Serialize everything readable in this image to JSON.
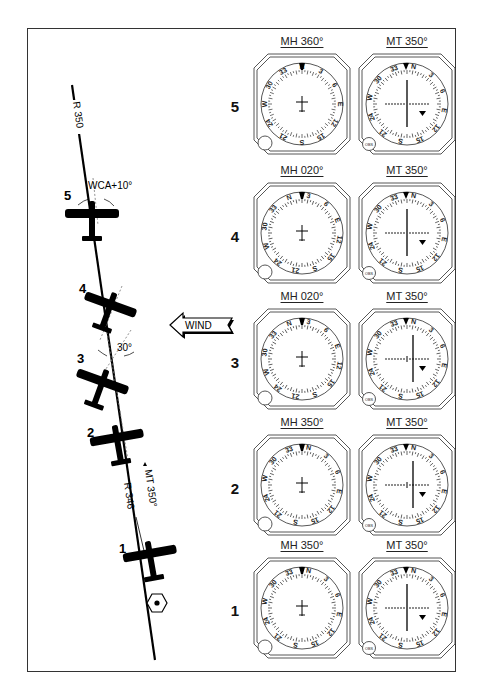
{
  "figure": {
    "wind_label": "WIND",
    "left_diagram": {
      "radial_top_label": "R 350",
      "radial_bottom_label": "R 346",
      "course_label": "MT 350°",
      "wca_label": "WCA+10°",
      "intercept_angle_label": "30°",
      "station_icon": "vor-station-hexagon-icon",
      "aircraft_positions": [
        {
          "number": "5",
          "heading_deg": 360
        },
        {
          "number": "4",
          "heading_deg": 20
        },
        {
          "number": "3",
          "heading_deg": 20
        },
        {
          "number": "2",
          "heading_deg": 350
        },
        {
          "number": "1",
          "heading_deg": 350
        }
      ]
    },
    "rows": [
      {
        "number": "5",
        "hi_title": "MH 360°",
        "hi_heading": 360,
        "vor_title": "MT 350°",
        "obs_course": 350,
        "cdi": "centered",
        "flag": "FROM"
      },
      {
        "number": "4",
        "hi_title": "MH 020°",
        "hi_heading": 20,
        "vor_title": "MT 350°",
        "obs_course": 350,
        "cdi": "centered",
        "flag": "FROM"
      },
      {
        "number": "3",
        "hi_title": "MH 020°",
        "hi_heading": 20,
        "vor_title": "MT 350°",
        "obs_course": 350,
        "cdi": "right",
        "flag": "FROM"
      },
      {
        "number": "2",
        "hi_title": "MH 350°",
        "hi_heading": 350,
        "vor_title": "MT 350°",
        "obs_course": 350,
        "cdi": "right",
        "flag": "FROM"
      },
      {
        "number": "1",
        "hi_title": "MH 350°",
        "hi_heading": 350,
        "vor_title": "MT 350°",
        "obs_course": 350,
        "cdi": "centered",
        "flag": "FROM"
      }
    ],
    "compass_labels": [
      "N",
      "3",
      "6",
      "E",
      "12",
      "15",
      "S",
      "21",
      "24",
      "W",
      "30",
      "33"
    ],
    "obs_knob_label": "OBS"
  }
}
